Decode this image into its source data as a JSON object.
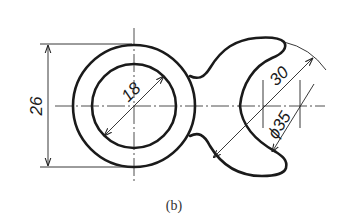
{
  "figure": {
    "caption": "(b)",
    "type": "engineering drawing — dimensioned part with ring and crescent (wrench-like) profile"
  },
  "dimensions": {
    "height_label": "26",
    "inner_diameter_label": "18",
    "crescent_width_label": "30",
    "outer_diameter_label": "ϕ35"
  },
  "colors": {
    "line": "#1a1a1a",
    "background": "#ffffff"
  }
}
